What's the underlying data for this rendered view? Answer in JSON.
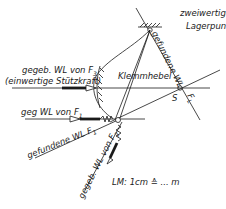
{
  "diagram": {
    "type": "force-diagram",
    "labels": {
      "bearing_point": "zweiwertiger",
      "bearing_point_2": "Lagerpunkt",
      "found_line_top": "gefundene WL",
      "clamp_lever": "Klemmhebel",
      "given_f3_line1": "gegeb. WL von F",
      "given_f3_sub": "3",
      "given_f3_line2": "(einwertige Stützkraft)",
      "given_f1": "geg WL von F",
      "given_f1_sub": "1",
      "found_f1": "gefundene WL F",
      "found_f1_sub": "1",
      "given_f2": "gegeb. WL von F",
      "given_f2_sub": "2",
      "point_s": "S",
      "force_fl": "F",
      "force_fl_sub": "L",
      "scale": "LM: 1cm ≙ ... m"
    },
    "colors": {
      "line": "#1a1a1a",
      "background": "#ffffff"
    }
  }
}
